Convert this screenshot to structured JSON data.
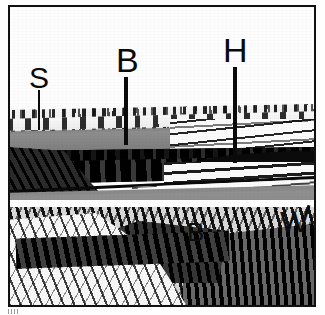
{
  "figure": {
    "kind": "geological-outcrop-sketch",
    "frame": {
      "border_color": "#111111",
      "background": "#ffffff"
    },
    "palette": {
      "ink": "#0a0a0a",
      "paper": "#ffffff",
      "grey_band": "#8b8b8b",
      "dark_seam": "#0d0d0d",
      "light_bed": "#fbfbfb"
    }
  },
  "labels": [
    {
      "id": "s",
      "text": "S",
      "has_leader_line": true,
      "leader_direction": "down",
      "points_to": "thin bedded layer at top of cliff, left side"
    },
    {
      "id": "b-top",
      "text": "B",
      "has_leader_line": true,
      "leader_direction": "down",
      "points_to": "upper grey band above dark seam, centre"
    },
    {
      "id": "h",
      "text": "H",
      "has_leader_line": true,
      "leader_direction": "down",
      "points_to": "dark seam on right-centre of exposure"
    },
    {
      "id": "b-low",
      "text": "B",
      "has_leader_line": false,
      "leader_direction": "none",
      "points_to": "lower grey band, centre-right"
    },
    {
      "id": "w",
      "text": "W",
      "has_leader_line": false,
      "leader_direction": "none",
      "points_to": "lower grey band at right edge, with small tick mark"
    }
  ],
  "units": [
    {
      "id": "sky",
      "name": "blank upper background"
    },
    {
      "id": "unit-s",
      "name": "thin horizontally bedded cap rock"
    },
    {
      "id": "unit-grey1",
      "name": "upper grey band"
    },
    {
      "id": "unit-dark",
      "name": "dark bituminous seam"
    },
    {
      "id": "wedge-right",
      "name": "light bedded wedge on right"
    },
    {
      "id": "unit-grey2",
      "name": "lower grey band"
    },
    {
      "id": "rubble",
      "name": "rubbly talus / scree slope at base"
    }
  ]
}
